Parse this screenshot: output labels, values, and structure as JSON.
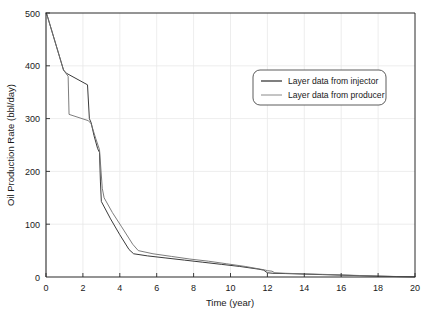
{
  "chart_data": {
    "type": "line",
    "title": "",
    "xlabel": "Time (year)",
    "ylabel": "Oil Production Rate (bbl/day)",
    "xlim": [
      0,
      20
    ],
    "ylim": [
      0,
      500
    ],
    "xticks": [
      0,
      2,
      4,
      6,
      8,
      10,
      12,
      14,
      16,
      18,
      20
    ],
    "yticks": [
      0,
      100,
      200,
      300,
      400,
      500
    ],
    "xtick_labels": [
      "0",
      "2",
      "4",
      "6",
      "8",
      "10",
      "12",
      "14",
      "16",
      "18",
      "20"
    ],
    "ytick_labels": [
      "0",
      "100",
      "200",
      "300",
      "400",
      "500"
    ],
    "grid": true,
    "grid_color": "#e8e8e8",
    "legend_position": "upper right",
    "series": [
      {
        "name": "Layer data from injector",
        "color": "#3a3a3a",
        "width": 1.0,
        "points": [
          [
            0.0,
            500
          ],
          [
            0.05,
            497
          ],
          [
            0.95,
            392
          ],
          [
            1.1,
            386
          ],
          [
            2.25,
            364
          ],
          [
            2.35,
            300
          ],
          [
            2.45,
            292
          ],
          [
            2.6,
            268
          ],
          [
            2.8,
            243
          ],
          [
            2.9,
            236
          ],
          [
            2.95,
            180
          ],
          [
            3.0,
            143
          ],
          [
            3.5,
            110
          ],
          [
            4.0,
            80
          ],
          [
            4.5,
            52
          ],
          [
            4.75,
            44
          ],
          [
            5.5,
            40
          ],
          [
            6.5,
            36
          ],
          [
            7.5,
            32
          ],
          [
            8.5,
            28
          ],
          [
            9.5,
            24
          ],
          [
            10.5,
            20
          ],
          [
            11.5,
            15
          ],
          [
            11.8,
            13
          ],
          [
            12.0,
            8
          ],
          [
            12.3,
            7
          ],
          [
            13.0,
            6.5
          ],
          [
            14.0,
            5.5
          ],
          [
            15.0,
            4.5
          ],
          [
            16.0,
            3.5
          ],
          [
            17.0,
            2.5
          ],
          [
            18.0,
            1.6
          ],
          [
            19.0,
            0.8
          ],
          [
            20.0,
            0.3
          ]
        ]
      },
      {
        "name": "Layer data from producer",
        "color": "#6e6e6e",
        "width": 0.9,
        "points": [
          [
            0.0,
            500
          ],
          [
            0.05,
            497
          ],
          [
            0.95,
            392
          ],
          [
            1.2,
            380
          ],
          [
            1.25,
            308
          ],
          [
            2.3,
            296
          ],
          [
            2.45,
            290
          ],
          [
            2.7,
            262
          ],
          [
            2.9,
            241
          ],
          [
            3.05,
            168
          ],
          [
            3.15,
            150
          ],
          [
            3.6,
            122
          ],
          [
            4.1,
            95
          ],
          [
            4.7,
            62
          ],
          [
            5.0,
            50
          ],
          [
            5.8,
            44
          ],
          [
            6.8,
            39
          ],
          [
            7.8,
            34
          ],
          [
            8.8,
            30
          ],
          [
            9.8,
            25
          ],
          [
            10.8,
            20
          ],
          [
            11.6,
            15
          ],
          [
            11.9,
            13
          ],
          [
            12.0,
            12
          ],
          [
            12.25,
            11
          ],
          [
            12.4,
            8
          ],
          [
            13.0,
            7
          ],
          [
            14.0,
            6
          ],
          [
            15.0,
            5
          ],
          [
            16.0,
            4
          ],
          [
            17.0,
            2.8
          ],
          [
            18.0,
            1.8
          ],
          [
            19.0,
            0.9
          ],
          [
            20.0,
            0.3
          ]
        ]
      }
    ]
  },
  "legend": {
    "entries": [
      {
        "label": "Layer data from injector"
      },
      {
        "label": "Layer data from producer"
      }
    ]
  },
  "axes": {
    "x_title": "Time (year)",
    "y_title": "Oil Production Rate (bbl/day)"
  }
}
